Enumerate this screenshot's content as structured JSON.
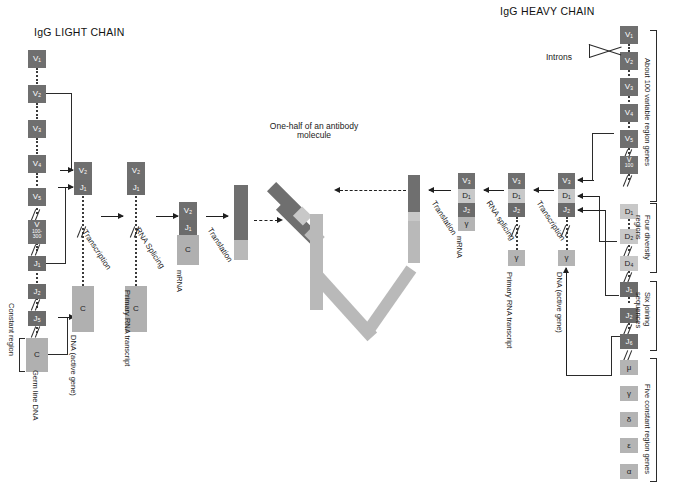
{
  "titles": {
    "light_chain": "IgG LIGHT CHAIN",
    "heavy_chain": "IgG HEAVY CHAIN",
    "antibody": "One-half of an antibody molecule"
  },
  "light_chain": {
    "germline_label": "Germ line DNA",
    "constant_region_label": "Constant region",
    "v_genes": [
      "V₁",
      "V₂",
      "V₃",
      "V₄",
      "V₅"
    ],
    "v_many": "V",
    "v_many_sub": "100-300",
    "j_genes": [
      "J₁",
      "J₂",
      "J₅"
    ],
    "c_gene": "C",
    "active_gene": {
      "label": "DNA (active gene)",
      "top": [
        "V₂",
        "J₁"
      ],
      "bottom": "C"
    },
    "primary_transcript": {
      "label": "Primary RNA transcript",
      "top": [
        "V₂",
        "J₁"
      ],
      "bottom": "C"
    },
    "mrna": {
      "label": "mRNA",
      "segments": [
        "V₂",
        "J₁",
        "C"
      ]
    },
    "steps": {
      "transcription": "Transcription",
      "splicing": "RNA Splicing",
      "translation": "Translation"
    }
  },
  "heavy_chain": {
    "introns_label": "Introns",
    "germline_brackets": [
      "About 100 variable region genes",
      "Four diversity regions",
      "Six joining sequences",
      "Five constant region genes"
    ],
    "v_genes": [
      "V₁",
      "V₂",
      "V₃",
      "V₄",
      "V₅"
    ],
    "v_many": "V",
    "v_many_sub": "100",
    "d_genes": [
      "D₁",
      "D₂",
      "D₄"
    ],
    "j_genes": [
      "J₁",
      "J₂",
      "J₆"
    ],
    "c_genes": [
      "μ",
      "γ",
      "δ",
      "ε",
      "α"
    ],
    "active_gene": {
      "label": "DNA (active gene)",
      "top": [
        "V₃",
        "D₁",
        "J₂"
      ],
      "bottom": "γ"
    },
    "primary_transcript": {
      "label": "Primary RNA transcript",
      "top": [
        "V₃",
        "D₁",
        "J₂"
      ],
      "bottom": "γ"
    },
    "mrna": {
      "label": "mRNA",
      "segments": [
        "V₃",
        "D₁",
        "J₂",
        "γ"
      ]
    },
    "steps": {
      "transcription": "Transcription",
      "splicing": "RNA splicing",
      "translation": "Translation"
    }
  },
  "colors": {
    "v_box": "#6f6f6f",
    "j_box": "#6b6b6b",
    "d_box": "#c8c8c8",
    "c_box": "#b4b4b4",
    "chain_light": "#b9b9b9",
    "chain_dark": "#6f6f6f",
    "line": "#2b2b2b",
    "background": "#ffffff"
  }
}
